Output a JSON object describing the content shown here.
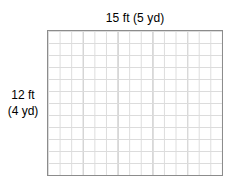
{
  "figure": {
    "type": "area-model-grid",
    "top_label": "15 ft (5 yd)",
    "left_label_line1": "12 ft",
    "left_label_line2": "(4 yd)",
    "grid": {
      "columns": 15,
      "rows": 12,
      "minor_unit": "ft",
      "major_unit": "yd",
      "cells_per_major": 3,
      "major_columns": 5,
      "major_rows": 4,
      "cell_width_px": 11.6,
      "cell_height_px": 12,
      "border_color": "#8c8c8c",
      "minor_line_color": "#dcdcdc",
      "major_line_color": "#b0b0b0",
      "fill_color": "#ffffff"
    },
    "dimensions": {
      "width_ft": 15,
      "width_yd": 5,
      "height_ft": 12,
      "height_yd": 4
    }
  }
}
